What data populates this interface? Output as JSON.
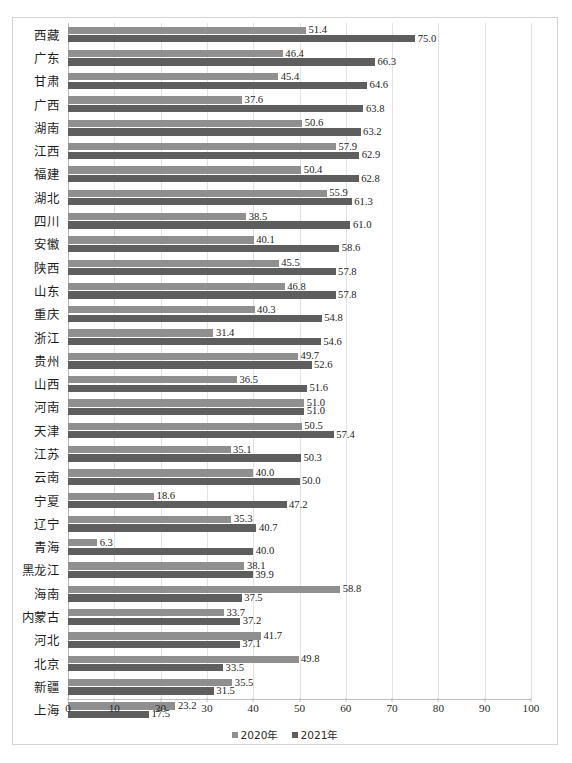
{
  "chart_data": {
    "type": "bar",
    "orientation": "horizontal",
    "title": "",
    "subtitle": "",
    "xlabel": "",
    "ylabel": "",
    "xlim": [
      0,
      100
    ],
    "xticks": [
      0,
      10,
      20,
      30,
      40,
      50,
      60,
      70,
      80,
      90,
      100
    ],
    "grid": true,
    "grid_axis": "x",
    "legend_position": "bottom",
    "categories": [
      "西藏",
      "广东",
      "甘肃",
      "广西",
      "湖南",
      "江西",
      "福建",
      "湖北",
      "四川",
      "安徽",
      "陕西",
      "山东",
      "重庆",
      "浙江",
      "贵州",
      "山西",
      "河南",
      "天津",
      "江苏",
      "云南",
      "宁夏",
      "辽宁",
      "青海",
      "黑龙江",
      "海南",
      "内蒙古",
      "河北",
      "北京",
      "新疆",
      "上海"
    ],
    "series": [
      {
        "name": "2020年",
        "color": "#8f8f8f",
        "values": [
          51.4,
          46.4,
          45.4,
          37.6,
          50.6,
          57.9,
          50.4,
          55.9,
          38.5,
          40.1,
          45.5,
          46.8,
          40.3,
          31.4,
          49.7,
          36.5,
          51.0,
          50.5,
          35.1,
          40.0,
          18.6,
          35.3,
          6.3,
          38.1,
          58.8,
          33.7,
          41.7,
          49.8,
          35.5,
          23.2
        ]
      },
      {
        "name": "2021年",
        "color": "#5e5e5e",
        "values": [
          75.0,
          66.3,
          64.6,
          63.8,
          63.2,
          62.9,
          62.8,
          61.3,
          61.0,
          58.6,
          57.8,
          57.8,
          54.8,
          54.6,
          52.6,
          51.6,
          51.0,
          57.4,
          50.3,
          50.0,
          47.2,
          40.7,
          40.0,
          39.9,
          37.5,
          37.2,
          37.1,
          33.5,
          31.5,
          17.5
        ]
      }
    ]
  },
  "legend": {
    "items": [
      {
        "label": "2020年",
        "color": "#8f8f8f",
        "marker": "square-marker"
      },
      {
        "label": "2021年",
        "color": "#5e5e5e",
        "marker": "square-marker"
      }
    ]
  },
  "colors": {
    "series_2020": "#8f8f8f",
    "series_2021": "#5e5e5e",
    "gridline": "#e2e2e2",
    "axis": "#bdbdbd",
    "frame": "#d4d4d4",
    "text": "#2b2b2b"
  }
}
